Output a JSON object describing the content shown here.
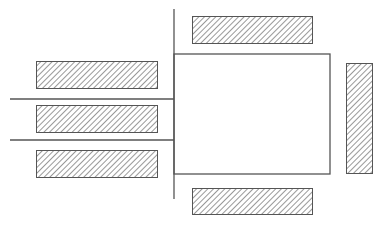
{
  "diagram": {
    "width": 382,
    "height": 227,
    "stroke_color": "#555555",
    "hatch_color": "#444444",
    "background": "#ffffff",
    "lines": [
      {
        "id": "vertical-divider",
        "x1": 174,
        "y1": 9,
        "x2": 174,
        "y2": 199
      },
      {
        "id": "left-line-upper",
        "x1": 10,
        "y1": 99,
        "x2": 174,
        "y2": 99
      },
      {
        "id": "left-line-lower",
        "x1": 10,
        "y1": 140,
        "x2": 174,
        "y2": 140
      }
    ],
    "box": {
      "id": "central-box",
      "x": 174,
      "y": 54,
      "w": 156,
      "h": 120
    },
    "hatched_bars": [
      {
        "id": "top-bar",
        "x": 192,
        "y": 16,
        "w": 120,
        "h": 27
      },
      {
        "id": "bottom-bar",
        "x": 192,
        "y": 188,
        "w": 120,
        "h": 26
      },
      {
        "id": "right-bar",
        "x": 346,
        "y": 63,
        "w": 26,
        "h": 110
      },
      {
        "id": "left-bar-1",
        "x": 36,
        "y": 61,
        "w": 121,
        "h": 27
      },
      {
        "id": "left-bar-2",
        "x": 36,
        "y": 105,
        "w": 121,
        "h": 27
      },
      {
        "id": "left-bar-3",
        "x": 36,
        "y": 150,
        "w": 121,
        "h": 27
      }
    ]
  }
}
